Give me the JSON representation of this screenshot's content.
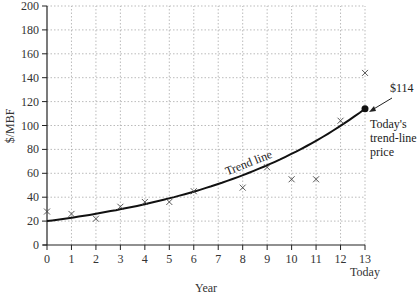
{
  "chart_data": {
    "type": "scatter",
    "title": "",
    "xlabel": "Year",
    "ylabel": "$/MBF",
    "xlim": [
      0,
      13
    ],
    "ylim": [
      0,
      200
    ],
    "x_ticks": [
      0,
      1,
      2,
      3,
      4,
      5,
      6,
      7,
      8,
      9,
      10,
      11,
      12,
      13
    ],
    "y_ticks": [
      0,
      20,
      40,
      60,
      80,
      100,
      120,
      140,
      160,
      180,
      200
    ],
    "x_end_label": "Today",
    "grid": true,
    "legend": "none",
    "series": [
      {
        "name": "Observed prices",
        "marker": "x",
        "x": [
          0,
          1,
          2,
          3,
          4,
          5,
          6,
          8,
          9,
          10,
          11,
          12,
          13
        ],
        "y": [
          28,
          26,
          22,
          32,
          36,
          36,
          45,
          48,
          65,
          55,
          55,
          104,
          144
        ]
      },
      {
        "name": "Trend line",
        "type": "line",
        "model": "exponential",
        "start": {
          "x": 0,
          "y": 20
        },
        "end": {
          "x": 13,
          "y": 114
        }
      }
    ],
    "annotations": [
      {
        "text": "Trend line",
        "x": 8.3,
        "y": 64,
        "rotated": true
      },
      {
        "text": "$114",
        "x": 13,
        "y": 114,
        "arrow": true
      },
      {
        "text": "Today's trend-line price",
        "x": 13,
        "y": 114
      }
    ]
  },
  "labels": {
    "xlabel": "Year",
    "ylabel": "$/MBF",
    "today": "Today",
    "trend": "Trend line",
    "price_value": "$114",
    "price_note_1": "Today's",
    "price_note_2": "trend-line",
    "price_note_3": "price"
  }
}
